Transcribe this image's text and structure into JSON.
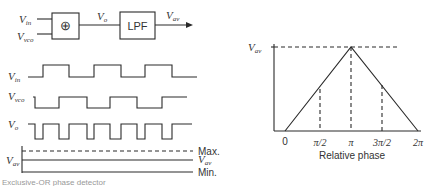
{
  "block_diagram": {
    "inputs": [
      {
        "main": "V",
        "sub": "in"
      },
      {
        "main": "V",
        "sub": "vco"
      }
    ],
    "xor_symbol": "⊕",
    "intermediate": {
      "main": "V",
      "sub": "o"
    },
    "filter_label": "LPF",
    "output": {
      "main": "V",
      "sub": "av"
    }
  },
  "waveforms": {
    "vin": {
      "main": "V",
      "sub": "in",
      "high_y": 65,
      "low_y": 77,
      "start_x": 28,
      "end_x": 197,
      "start_level": "low",
      "edges": [
        43,
        69,
        94,
        121,
        145,
        172
      ]
    },
    "vvco": {
      "main": "V",
      "sub": "vco",
      "high_y": 97,
      "low_y": 108,
      "start_x": 33,
      "end_x": 187,
      "start_level": "high",
      "edges": [
        35,
        59,
        87,
        110,
        137,
        162
      ]
    },
    "vo": {
      "main": "V",
      "sub": "o",
      "high_y": 124,
      "low_y": 139,
      "start_x": 28,
      "end_x": 192,
      "start_level": "high",
      "edges": [
        35,
        43,
        59,
        69,
        87,
        94,
        110,
        121,
        137,
        145,
        162,
        172
      ]
    }
  },
  "levels": {
    "axis_label": {
      "main": "V",
      "sub": "av"
    },
    "max_label": "Max.",
    "vav_label": {
      "main": "V",
      "sub": "av"
    },
    "min_label": "Min."
  },
  "caption": "Exclusive-OR phase detector",
  "chart_data": {
    "type": "line",
    "title": "",
    "xlabel": "Relative phase",
    "ylabel": "V_av",
    "x_tick_labels": [
      "0",
      "π/2",
      "π",
      "3π/2",
      "2π"
    ],
    "x": [
      0,
      1.5708,
      3.1416,
      4.7124,
      6.2832
    ],
    "values": [
      0,
      0.5,
      1.0,
      0.5,
      0
    ],
    "y_tick_labels": [
      "V_av"
    ],
    "ylim": [
      0,
      1
    ],
    "grid": false,
    "annotations": [
      "dashed drop lines at π/2, π, 3π/2",
      "dashed horizontal line at max V_av"
    ]
  },
  "phase_chart": {
    "y_label": {
      "main": "V",
      "sub": "av"
    },
    "xlabel": "Relative phase",
    "ticks": [
      "0",
      "π/2",
      "π",
      "3π/2",
      "2π"
    ]
  }
}
